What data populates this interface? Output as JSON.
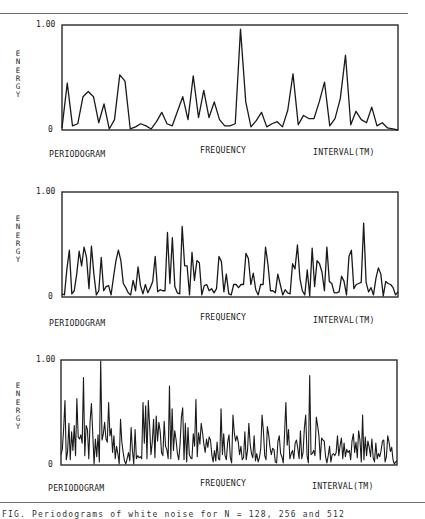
{
  "figure": {
    "caption": "FIG. Periodograms of white noise for N = 128, 256 and 512"
  },
  "colors": {
    "line": "#1a1a1a",
    "frame": "#2a2a2a",
    "rule": "#6e6e6e"
  },
  "panels": [
    {
      "ylabel": "E\nN\nE\nR\nG\nY",
      "ytick_top": "1.00",
      "ytick_bottom": "0",
      "xlabel_left": "PERIODOGRAM",
      "xlabel_center": "FREQUENCY",
      "xlabel_right": "INTERVAL(TM)"
    },
    {
      "ylabel": "E\nN\nE\nR\nG\nY",
      "ytick_top": "1.00",
      "ytick_bottom": "0",
      "xlabel_left": "PERIODOGRAM",
      "xlabel_center": "FREQUENCY",
      "xlabel_right": "INTERVAL(TM)"
    },
    {
      "ylabel": "E\nN\nE\nR\nG\nY",
      "ytick_top": "1.00",
      "ytick_bottom": "0",
      "xlabel_left": "PERIODOGRAM",
      "xlabel_center": "FREQUENCY",
      "xlabel_right": "INTERVAL(TM)"
    }
  ],
  "chart_data": [
    {
      "type": "line",
      "title": "",
      "xlabel": "FREQUENCY",
      "ylabel": "ENERGY",
      "ylim": [
        0,
        1.0
      ],
      "yticks": [
        "0",
        "1.00"
      ],
      "grid": false,
      "legend": null,
      "annotations": [
        "PERIODOGRAM",
        "INTERVAL(TM)"
      ],
      "series": [
        {
          "name": "periodogram-1",
          "values": [
            0.02,
            0.45,
            0.04,
            0.06,
            0.32,
            0.37,
            0.32,
            0.07,
            0.25,
            0.01,
            0.1,
            0.53,
            0.47,
            0.01,
            0.03,
            0.06,
            0.04,
            0.01,
            0.08,
            0.17,
            0.06,
            0.04,
            0.18,
            0.32,
            0.1,
            0.52,
            0.12,
            0.38,
            0.12,
            0.27,
            0.1,
            0.04,
            0.04,
            0.06,
            0.97,
            0.27,
            0.03,
            0.09,
            0.17,
            0.03,
            0.06,
            0.08,
            0.03,
            0.19,
            0.54,
            0.05,
            0.14,
            0.11,
            0.11,
            0.27,
            0.46,
            0.04,
            0.11,
            0.3,
            0.72,
            0.05,
            0.18,
            0.1,
            0.07,
            0.22,
            0.04,
            0.07,
            0.02,
            0.01,
            0.0
          ]
        }
      ]
    },
    {
      "type": "line",
      "title": "",
      "xlabel": "FREQUENCY",
      "ylabel": "ENERGY",
      "ylim": [
        0,
        1.0
      ],
      "yticks": [
        "0",
        "1.00"
      ],
      "grid": false,
      "legend": null,
      "annotations": [
        "PERIODOGRAM",
        "INTERVAL(TM)"
      ],
      "series": [
        {
          "name": "periodogram-2",
          "values": [
            0.03,
            0.02,
            0.27,
            0.45,
            0.03,
            0.06,
            0.22,
            0.44,
            0.3,
            0.48,
            0.38,
            0.08,
            0.49,
            0.22,
            0.02,
            0.06,
            0.38,
            0.06,
            0.1,
            0.11,
            0.02,
            0.19,
            0.35,
            0.45,
            0.35,
            0.13,
            0.09,
            0.04,
            0.02,
            0.16,
            0.06,
            0.29,
            0.11,
            0.03,
            0.12,
            0.04,
            0.09,
            0.15,
            0.39,
            0.05,
            0.07,
            0.06,
            0.06,
            0.62,
            0.13,
            0.57,
            0.1,
            0.04,
            0.03,
            0.68,
            0.3,
            0.3,
            0.02,
            0.43,
            0.16,
            0.35,
            0.33,
            0.02,
            0.11,
            0.12,
            0.06,
            0.08,
            0.04,
            0.08,
            0.39,
            0.34,
            0.05,
            0.22,
            0.03,
            0.02,
            0.12,
            0.12,
            0.09,
            0.12,
            0.12,
            0.42,
            0.37,
            0.12,
            0.23,
            0.07,
            0.02,
            0.12,
            0.12,
            0.48,
            0.31,
            0.06,
            0.06,
            0.04,
            0.22,
            0.12,
            0.02,
            0.07,
            0.04,
            0.03,
            0.32,
            0.27,
            0.5,
            0.18,
            0.06,
            0.02,
            0.26,
            0.01,
            0.47,
            0.1,
            0.35,
            0.32,
            0.24,
            0.06,
            0.48,
            0.15,
            0.13,
            0.04,
            0.04,
            0.05,
            0.2,
            0.15,
            0.02,
            0.39,
            0.45,
            0.08,
            0.12,
            0.13,
            0.14,
            0.71,
            0.14,
            0.05,
            0.09,
            0.02,
            0.18,
            0.28,
            0.22,
            0.01,
            0.15,
            0.13,
            0.12,
            0.09,
            0.02,
            0.05
          ]
        }
      ]
    },
    {
      "type": "line",
      "title": "",
      "xlabel": "FREQUENCY",
      "ylabel": "ENERGY",
      "ylim": [
        0,
        1.0
      ],
      "yticks": [
        "0",
        "1.00"
      ],
      "grid": false,
      "legend": null,
      "annotations": [
        "PERIODOGRAM",
        "INTERVAL(TM)"
      ],
      "series": [
        {
          "name": "periodogram-3",
          "values": [
            0.1,
            0.15,
            0.35,
            0.62,
            0.05,
            0.13,
            0.4,
            0.05,
            0.32,
            0.14,
            0.38,
            0.09,
            0.64,
            0.27,
            0.25,
            0.29,
            0.21,
            0.84,
            0.09,
            0.38,
            0.34,
            0.06,
            0.42,
            0.59,
            0.3,
            0.01,
            0.25,
            0.08,
            0.29,
            0.03,
            1.0,
            0.24,
            0.3,
            0.41,
            0.25,
            0.22,
            0.6,
            0.28,
            0.35,
            0.12,
            0.28,
            0.06,
            0.18,
            0.11,
            0.01,
            0.44,
            0.22,
            0.12,
            0.04,
            0.01,
            0.06,
            0.12,
            0.04,
            0.36,
            0.14,
            0.01,
            0.34,
            0.06,
            0.09,
            0.07,
            0.08,
            0.06,
            0.6,
            0.21,
            0.57,
            0.06,
            0.62,
            0.38,
            0.1,
            0.22,
            0.44,
            0.07,
            0.47,
            0.23,
            0.41,
            0.32,
            0.12,
            0.09,
            0.42,
            0.18,
            0.15,
            0.06,
            0.76,
            0.06,
            0.54,
            0.14,
            0.33,
            0.24,
            0.11,
            0.05,
            0.2,
            0.46,
            0.55,
            0.05,
            0.4,
            0.03,
            0.36,
            0.1,
            0.07,
            0.06,
            0.3,
            0.18,
            0.63,
            0.08,
            0.31,
            0.2,
            0.4,
            0.31,
            0.2,
            0.12,
            0.25,
            0.17,
            0.27,
            0.24,
            0.1,
            0.03,
            0.14,
            0.04,
            0.22,
            0.06,
            0.05,
            0.54,
            0.1,
            0.3,
            0.09,
            0.05,
            0.22,
            0.29,
            0.07,
            0.02,
            0.48,
            0.31,
            0.23,
            0.28,
            0.22,
            0.1,
            0.18,
            0.05,
            0.07,
            0.32,
            0.05,
            0.14,
            0.4,
            0.2,
            0.11,
            0.07,
            0.28,
            0.04,
            0.11,
            0.03,
            0.07,
            0.16,
            0.48,
            0.33,
            0.09,
            0.05,
            0.37,
            0.29,
            0.17,
            0.1,
            0.16,
            0.15,
            0.03,
            0.02,
            0.23,
            0.28,
            0.11,
            0.08,
            0.02,
            0.3,
            0.6,
            0.19,
            0.34,
            0.06,
            0.11,
            0.14,
            0.06,
            0.21,
            0.24,
            0.16,
            0.06,
            0.33,
            0.06,
            0.12,
            0.36,
            0.48,
            0.09,
            0.02,
            0.86,
            0.1,
            0.11,
            0.14,
            0.09,
            0.46,
            0.38,
            0.28,
            0.05,
            0.26,
            0.24,
            0.23,
            0.08,
            0.02,
            0.09,
            0.18,
            0.03,
            0.1,
            0.11,
            0.09,
            0.12,
            0.28,
            0.09,
            0.19,
            0.26,
            0.06,
            0.21,
            0.08,
            0.15,
            0.12,
            0.14,
            0.05,
            0.23,
            0.3,
            0.12,
            0.22,
            0.07,
            0.33,
            0.24,
            0.03,
            0.48,
            0.05,
            0.27,
            0.09,
            0.23,
            0.17,
            0.08,
            0.25,
            0.07,
            0.03,
            0.21,
            0.06,
            0.11,
            0.08,
            0.14,
            0.23,
            0.24,
            0.03,
            0.08,
            0.28,
            0.22,
            0.13,
            0.17,
            0.05,
            0.01,
            0.03,
            0.04
          ]
        }
      ]
    }
  ]
}
